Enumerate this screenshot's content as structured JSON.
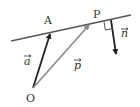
{
  "diagram": {
    "points": {
      "O": {
        "label": "O",
        "x": 33,
        "y": 88
      },
      "A": {
        "label": "A",
        "x": 50,
        "y": 33
      },
      "P": {
        "label": "P",
        "x": 90,
        "y": 24
      }
    },
    "line": {
      "x1": 11,
      "y1": 41,
      "x2": 131,
      "y2": 15,
      "color": "#555555"
    },
    "vectors": [
      {
        "name": "a",
        "label": "a",
        "from": "O",
        "to": "A",
        "color": "#222222"
      },
      {
        "name": "p",
        "label": "p",
        "from": "O",
        "to": "P",
        "color": "#888888"
      },
      {
        "name": "n",
        "label": "n",
        "from": [
          111,
          20
        ],
        "to": [
          116,
          55
        ],
        "color": "#222222"
      }
    ],
    "right_angle_marker": true,
    "colors": {
      "dark": "#222222",
      "gray": "#888888",
      "line": "#555555"
    }
  }
}
